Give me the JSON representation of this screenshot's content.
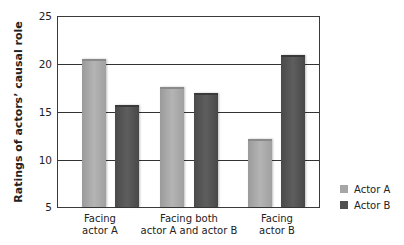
{
  "chart_data": {
    "type": "bar",
    "title": "",
    "xlabel": "",
    "ylabel": "Ratings of actors’ causal role",
    "ylim": [
      5,
      25
    ],
    "yticks": [
      5,
      10,
      15,
      20,
      25
    ],
    "grid": true,
    "legend_position": "right-bottom",
    "categories": [
      "Facing actor A",
      "Facing both actor A and actor B",
      "Facing actor B"
    ],
    "category_labels": [
      [
        "Facing",
        "actor A"
      ],
      [
        "Facing both",
        "actor A and actor B"
      ],
      [
        "Facing",
        "actor B"
      ]
    ],
    "series": [
      {
        "name": "Actor A",
        "color": "#a6a6a6",
        "values": [
          20.4,
          17.4,
          12.0
        ]
      },
      {
        "name": "Actor B",
        "color": "#505050",
        "values": [
          15.5,
          16.8,
          20.8
        ]
      }
    ]
  },
  "axis": {
    "ylabel": "Ratings of actors’ causal role",
    "ticks": [
      "25",
      "20",
      "15",
      "10",
      "5"
    ]
  },
  "xlabels": [
    {
      "line1": "Facing",
      "line2": "actor A"
    },
    {
      "line1": "Facing both",
      "line2": "actor A and actor B"
    },
    {
      "line1": "Facing",
      "line2": "actor B"
    }
  ],
  "legend": {
    "items": [
      {
        "label": "Actor A"
      },
      {
        "label": "Actor B"
      }
    ]
  }
}
